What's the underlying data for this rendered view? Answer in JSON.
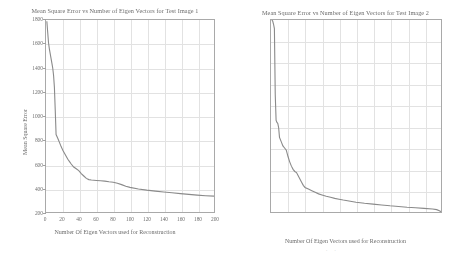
{
  "figure_left": {
    "title": "Mean Square Error vs Number of Eigen Vectors for Test Image 1",
    "xlabel": "Number Of Eigen Vectors used for Reconstruction",
    "ylabel": "Mean Square Error"
  },
  "figure_right": {
    "title": "Mean Square Error vs Number of Eigen Vectors for Test Image 2",
    "xlabel": "Number Of Eigen Vectors used for Reconstruction",
    "ylabel": "Mean Square Error",
    "stray_marks": ". ."
  },
  "style": {
    "line_color": "#8a8a8a",
    "grid_color": "#e2e2e2",
    "axis_color": "#a9a9a9",
    "text_color": "#6b6b6b",
    "background": "#ffffff"
  },
  "chart_data": [
    {
      "type": "line",
      "id": "test-image-1",
      "title": "Mean Square Error vs Number of Eigen Vectors for Test Image 1",
      "xlabel": "Number Of Eigen Vectors used for Reconstruction",
      "ylabel": "Mean Square Error",
      "xlim": [
        0,
        200
      ],
      "ylim": [
        200,
        1800
      ],
      "xticks": [
        0,
        20,
        40,
        60,
        80,
        100,
        120,
        140,
        160,
        180,
        200
      ],
      "yticks": [
        200,
        400,
        600,
        800,
        1000,
        1200,
        1400,
        1600,
        1800
      ],
      "grid": true,
      "legend": "none",
      "series": [
        {
          "name": "MSE",
          "x": [
            1,
            2,
            3,
            4,
            5,
            6,
            7,
            8,
            9,
            10,
            11,
            12,
            14,
            16,
            18,
            20,
            22,
            24,
            26,
            28,
            30,
            33,
            36,
            39,
            42,
            45,
            48,
            51,
            54,
            57,
            60,
            65,
            70,
            75,
            80,
            85,
            90,
            95,
            100,
            110,
            120,
            130,
            140,
            150,
            160,
            170,
            180,
            190,
            200
          ],
          "values": [
            1790,
            1700,
            1610,
            1560,
            1520,
            1480,
            1440,
            1400,
            1340,
            1240,
            1050,
            845,
            815,
            780,
            745,
            715,
            690,
            665,
            640,
            620,
            600,
            575,
            560,
            545,
            520,
            500,
            480,
            470,
            467,
            465,
            463,
            460,
            457,
            452,
            448,
            440,
            428,
            415,
            405,
            392,
            382,
            374,
            367,
            360,
            353,
            347,
            341,
            336,
            332
          ]
        }
      ]
    },
    {
      "type": "line",
      "id": "test-image-2",
      "title": "Mean Square Error vs Number of Eigen Vectors for Test Image 2",
      "xlabel": "Number Of Eigen Vectors used for Reconstruction",
      "ylabel": "Mean Square Error",
      "xlim": [
        0,
        200
      ],
      "ylim": [
        0,
        1800
      ],
      "xticks": [
        0,
        20,
        40,
        60,
        80,
        100,
        120,
        140,
        160,
        180,
        200
      ],
      "yticks": [
        0,
        200,
        400,
        600,
        800,
        1000,
        1200,
        1400,
        1600,
        1800
      ],
      "grid": true,
      "legend": "none",
      "series": [
        {
          "name": "MSE",
          "x": [
            1,
            2,
            3,
            4,
            5,
            6,
            7,
            8,
            9,
            10,
            12,
            14,
            16,
            18,
            20,
            22,
            24,
            26,
            28,
            30,
            32,
            34,
            36,
            38,
            40,
            44,
            48,
            52,
            56,
            60,
            65,
            70,
            75,
            80,
            85,
            90,
            100,
            110,
            120,
            130,
            140,
            150,
            160,
            170,
            180,
            190,
            195,
            198,
            200
          ],
          "values": [
            1800,
            1790,
            1760,
            1720,
            1100,
            860,
            840,
            830,
            790,
            700,
            660,
            620,
            600,
            580,
            520,
            470,
            430,
            400,
            380,
            370,
            340,
            310,
            280,
            250,
            230,
            215,
            200,
            185,
            170,
            160,
            148,
            138,
            128,
            120,
            112,
            105,
            92,
            82,
            74,
            66,
            58,
            52,
            45,
            40,
            34,
            28,
            22,
            12,
            3
          ]
        }
      ]
    }
  ]
}
